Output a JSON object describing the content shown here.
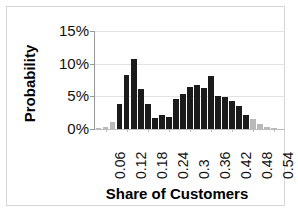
{
  "chart_data": {
    "type": "bar",
    "title": "",
    "subtitle": "",
    "xlabel": "Share of Customers",
    "ylabel": "Probability",
    "ylim": [
      0,
      15
    ],
    "y_unit": "%",
    "ytick_labels": [
      "0%",
      "5%",
      "10%",
      "15%"
    ],
    "ytick_values": [
      0,
      5,
      10,
      15
    ],
    "xtick_labels": [
      "0.06",
      "0.12",
      "0.18",
      "0.24",
      "0.3",
      "0.36",
      "0.42",
      "0.48",
      "0.54"
    ],
    "xtick_values": [
      0.06,
      0.12,
      0.18,
      0.24,
      0.3,
      0.36,
      0.42,
      0.48,
      0.54
    ],
    "xlim": [
      0.03,
      0.57
    ],
    "bin_width": 0.02,
    "grid": "horizontal",
    "legend": "none",
    "colors": {
      "bar_main": "#1b1b1b",
      "bar_tail": "#b9b9b9",
      "gridline": "#e2e2e2",
      "axis": "#9a9a9a",
      "frame": "#d5d5d5",
      "text": "#111111",
      "background": "#ffffff"
    },
    "series": [
      {
        "name": "Probability",
        "categories": [
          0.04,
          0.06,
          0.08,
          0.1,
          0.12,
          0.14,
          0.16,
          0.18,
          0.2,
          0.22,
          0.24,
          0.26,
          0.28,
          0.3,
          0.32,
          0.34,
          0.36,
          0.38,
          0.4,
          0.42,
          0.44,
          0.46,
          0.48,
          0.5,
          0.52,
          0.54,
          0.56
        ],
        "values": [
          0.2,
          0.3,
          1.1,
          3.9,
          8.3,
          10.7,
          6.1,
          3.9,
          1.7,
          2.1,
          1.8,
          4.6,
          5.4,
          6.5,
          6.8,
          6.3,
          8.1,
          5.1,
          4.9,
          4.3,
          3.5,
          2.1,
          1.5,
          0.8,
          0.3,
          0.1,
          0.05
        ],
        "shades": [
          "tail",
          "tail",
          "tail",
          "main",
          "main",
          "main",
          "main",
          "main",
          "main",
          "main",
          "main",
          "main",
          "main",
          "main",
          "main",
          "main",
          "main",
          "main",
          "main",
          "main",
          "main",
          "main",
          "tail",
          "tail",
          "tail",
          "tail",
          "tail"
        ]
      }
    ]
  }
}
